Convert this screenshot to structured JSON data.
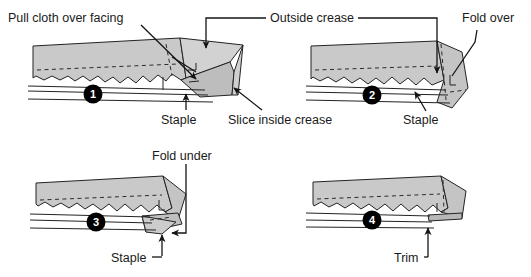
{
  "diagram": {
    "colors": {
      "cloth_fill": "#c9c9c9",
      "cloth_fill_dark": "#b4b4b4",
      "cloth_fill_light": "#d8d8d8",
      "outline": "#232323",
      "badge_fill": "#000000",
      "badge_text": "#ffffff",
      "background": "#ffffff"
    },
    "panels": [
      {
        "id": "panel-1",
        "badge": "1",
        "labels": [
          {
            "name": "pull-cloth-over-facing-label",
            "text": "Pull cloth over facing"
          },
          {
            "name": "staple-label",
            "text": "Staple"
          },
          {
            "name": "slice-inside-crease-label",
            "text": "Slice inside crease"
          }
        ]
      },
      {
        "id": "panel-2",
        "badge": "2",
        "labels": [
          {
            "name": "outside-crease-label",
            "text": "Outside crease"
          },
          {
            "name": "fold-over-label",
            "text": "Fold over"
          },
          {
            "name": "staple-label",
            "text": "Staple"
          }
        ]
      },
      {
        "id": "panel-3",
        "badge": "3",
        "labels": [
          {
            "name": "fold-under-label",
            "text": "Fold under"
          },
          {
            "name": "staple-label",
            "text": "Staple"
          }
        ]
      },
      {
        "id": "panel-4",
        "badge": "4",
        "labels": [
          {
            "name": "trim-label",
            "text": "Trim"
          }
        ]
      }
    ],
    "text": {
      "pull_cloth_over_facing": "Pull cloth over facing",
      "staple_1": "Staple",
      "slice_inside_crease": "Slice inside crease",
      "outside_crease": "Outside crease",
      "fold_over": "Fold over",
      "staple_2": "Staple",
      "fold_under": "Fold under",
      "staple_3": "Staple",
      "trim": "Trim",
      "badge_1": "1",
      "badge_2": "2",
      "badge_3": "3",
      "badge_4": "4"
    }
  }
}
